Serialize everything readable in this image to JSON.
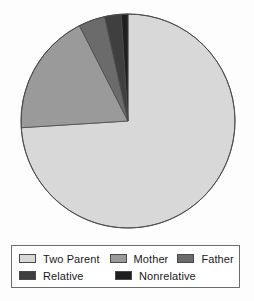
{
  "chart_data": {
    "type": "pie",
    "title": "",
    "subtitle": "",
    "xlabel": "",
    "ylabel": "",
    "grid": false,
    "legend_position": "bottom",
    "start_angle_deg": 0,
    "direction": "clockwise",
    "categories": [
      "Two Parent",
      "Mother",
      "Father",
      "Relative",
      "Nonrelative"
    ],
    "values": [
      74.0,
      18.5,
      4.0,
      2.5,
      1.0
    ],
    "units": "percent",
    "slices": [
      {
        "label": "Two Parent",
        "value": 74.0,
        "angle_deg": 266.4,
        "color": "#d8d8d8"
      },
      {
        "label": "Mother",
        "value": 18.5,
        "angle_deg": 66.6,
        "color": "#9a9a9a"
      },
      {
        "label": "Father",
        "value": 4.0,
        "angle_deg": 14.4,
        "color": "#6b6b6b"
      },
      {
        "label": "Relative",
        "value": 2.5,
        "angle_deg": 9.0,
        "color": "#3f3f3f"
      },
      {
        "label": "Nonrelative",
        "value": 1.0,
        "angle_deg": 3.6,
        "color": "#1f1f1f"
      }
    ]
  },
  "legend": {
    "rows": [
      [
        {
          "label": "Two Parent",
          "color": "#d8d8d8"
        },
        {
          "label": "Mother",
          "color": "#9a9a9a"
        },
        {
          "label": "Father",
          "color": "#6b6b6b"
        }
      ],
      [
        {
          "label": "Relative",
          "color": "#3f3f3f"
        },
        {
          "label": "Nonrelative",
          "color": "#1f1f1f"
        }
      ]
    ]
  },
  "colors": {
    "two_parent": "#d8d8d8",
    "mother": "#9a9a9a",
    "father": "#6b6b6b",
    "relative": "#3f3f3f",
    "nonrelative": "#1f1f1f",
    "outline": "#4a4a4a",
    "legend_border": "#6d6d6d",
    "background": "#fdfdfd"
  },
  "geometry": {
    "center_x": 128,
    "center_y": 121,
    "radius": 107
  }
}
